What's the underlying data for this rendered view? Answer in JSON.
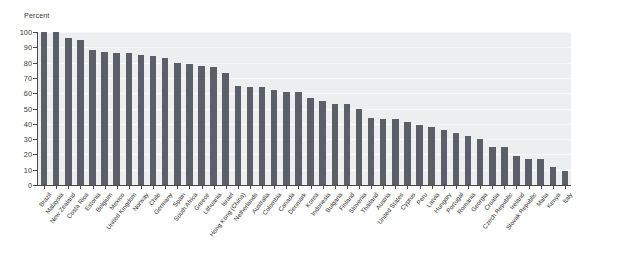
{
  "chart_data": {
    "type": "bar",
    "title": "",
    "subtitle": "",
    "xlabel": "",
    "ylabel": "Percent",
    "unit_label": "Percent",
    "ylim": [
      0,
      100
    ],
    "ytick_labels": [
      "0",
      "10",
      "20",
      "30",
      "40",
      "50",
      "60",
      "70",
      "80",
      "90",
      "100"
    ],
    "ytick_values": [
      0,
      10,
      20,
      30,
      40,
      50,
      60,
      70,
      80,
      90,
      100
    ],
    "grid": true,
    "legend": "none",
    "orientation": "vertical",
    "bar_color": "#5b6068",
    "plot_background": "#eceef0",
    "categories": [
      "Brazil",
      "Malaysia",
      "New Zealand",
      "Costa Rica",
      "Estonia",
      "Belgium",
      "Mexico",
      "United Kingdom",
      "Norway",
      "Chile",
      "Germany",
      "Spain",
      "South Africa",
      "Greece",
      "Lithuania",
      "Israel",
      "Hong Kong (China)",
      "Netherlands",
      "Australia",
      "Colombia",
      "Canada",
      "Denmark",
      "Korea",
      "Indonesia",
      "Bulgaria",
      "Finland",
      "Slovenia",
      "Thailand",
      "Austria",
      "United States",
      "Cyprus",
      "Peru",
      "Latvia",
      "Hungary",
      "Portugal",
      "Romania",
      "Georgia",
      "Croatia",
      "Czech Republic",
      "Ireland",
      "Slovak Republic",
      "Malta",
      "Kenya",
      "Italy"
    ],
    "values": [
      100,
      100,
      96,
      95,
      88,
      87,
      86,
      86,
      85,
      84,
      83,
      80,
      79,
      78,
      77,
      73,
      65,
      64,
      64,
      62,
      61,
      61,
      57,
      55,
      53,
      53,
      50,
      44,
      43,
      43,
      41,
      39,
      38,
      36,
      34,
      32,
      30,
      25,
      25,
      19,
      17,
      17,
      12,
      9
    ]
  }
}
